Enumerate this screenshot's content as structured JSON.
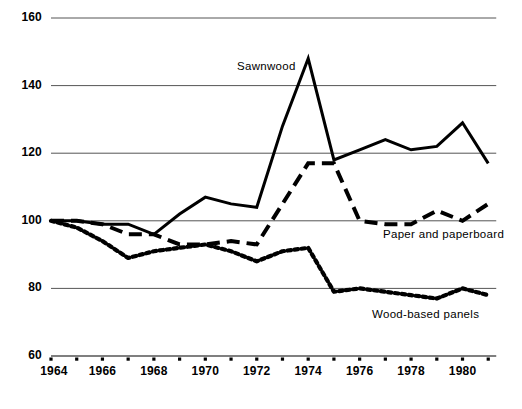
{
  "chart_data": {
    "type": "line",
    "title": "",
    "subtitle": "",
    "xlabel": "",
    "ylabel": "",
    "xlim": [
      1964,
      1981
    ],
    "ylim": [
      60,
      160
    ],
    "grid": true,
    "gridlines_y": [
      60,
      80,
      100,
      120,
      140,
      160
    ],
    "legend_position": "inline-annotations",
    "x": [
      1964,
      1965,
      1966,
      1967,
      1968,
      1969,
      1970,
      1971,
      1972,
      1973,
      1974,
      1975,
      1976,
      1977,
      1978,
      1979,
      1980,
      1981
    ],
    "ytick_labels": [
      "60",
      "80",
      "100",
      "120",
      "140",
      "160"
    ],
    "xtick_labels": [
      "1964",
      "1966",
      "1968",
      "1970",
      "1972",
      "1974",
      "1976",
      "1978",
      "1980"
    ],
    "xtick_values": [
      1964,
      1966,
      1968,
      1970,
      1972,
      1974,
      1976,
      1978,
      1980
    ],
    "xtick_minor_values": [
      1965,
      1967,
      1969,
      1971,
      1973,
      1975,
      1977,
      1979,
      1981
    ],
    "series": [
      {
        "name": "Sawnwood",
        "style": "solid",
        "color": "#000000",
        "label": "Sawnwood",
        "values": [
          100,
          100,
          99,
          99,
          96,
          102,
          107,
          105,
          104,
          128,
          148,
          118,
          121,
          124,
          121,
          122,
          129,
          117
        ]
      },
      {
        "name": "Paper and paperboard",
        "style": "dashed",
        "color": "#000000",
        "label": "Paper and paperboard",
        "values": [
          100,
          100,
          99,
          96,
          96,
          93,
          93,
          94,
          93,
          105,
          117,
          117,
          100,
          99,
          99,
          103,
          100,
          105
        ]
      },
      {
        "name": "Wood-based panels",
        "style": "dotted",
        "color": "#000000",
        "label": "Wood-based panels",
        "values": [
          100,
          98,
          94,
          89,
          91,
          92,
          93,
          91,
          88,
          91,
          92,
          79,
          80,
          79,
          78,
          77,
          80,
          78
        ]
      }
    ],
    "axis_color": "#555555",
    "line_color": "#000000"
  }
}
